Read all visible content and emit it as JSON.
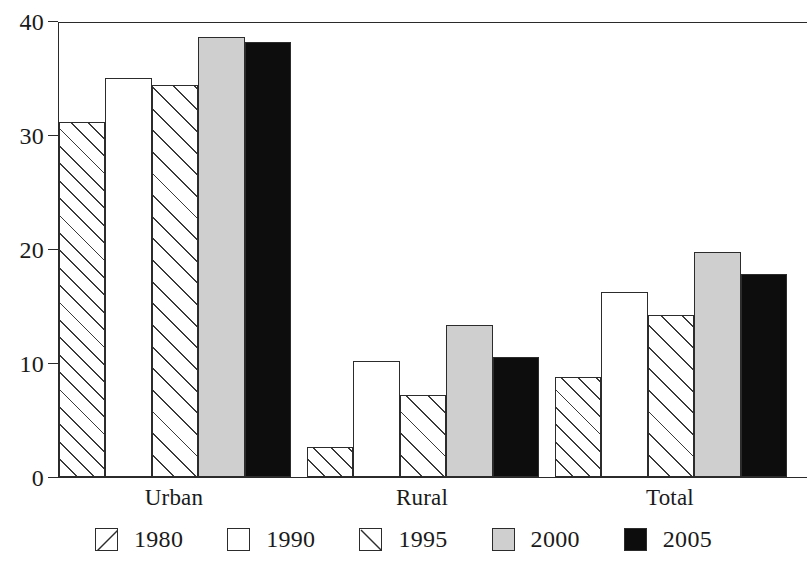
{
  "chart_data": {
    "type": "bar",
    "title": "",
    "subtitle": "",
    "xlabel": "",
    "ylabel": "",
    "categories": [
      "Urban",
      "Rural",
      "Total"
    ],
    "series": [
      {
        "name": "1980",
        "values": [
          31.1,
          2.6,
          8.8
        ],
        "fill": "hatch-forward",
        "color": "#ffffff"
      },
      {
        "name": "1990",
        "values": [
          35.0,
          10.2,
          16.2
        ],
        "fill": "white",
        "color": "#ffffff"
      },
      {
        "name": "1995",
        "values": [
          34.4,
          7.2,
          14.2
        ],
        "fill": "hatch-forward-wide",
        "color": "#ffffff"
      },
      {
        "name": "2000",
        "values": [
          38.6,
          13.3,
          19.7
        ],
        "fill": "solid",
        "color": "#cfcfcf"
      },
      {
        "name": "2005",
        "values": [
          38.2,
          10.5,
          17.8
        ],
        "fill": "solid",
        "color": "#0d0d0d"
      }
    ],
    "ylim": [
      0,
      40
    ],
    "yticks": [
      0,
      10,
      20,
      30,
      40
    ],
    "ytick_labels": [
      "0",
      "10",
      "20",
      "30",
      "40"
    ],
    "grid": false,
    "legend_position": "bottom",
    "legend_entries": [
      "1980",
      "1990",
      "1995",
      "2000",
      "2005"
    ],
    "annotations": [],
    "axis_color": "#2a2a2a"
  },
  "legend": {
    "items": [
      {
        "label": "1980",
        "key": "legend-key-hatch-forward"
      },
      {
        "label": "1990",
        "key": "legend-key-empty"
      },
      {
        "label": "1995",
        "key": "legend-key-hatch-backward"
      },
      {
        "label": "2000",
        "key": "legend-key-gray"
      },
      {
        "label": "2005",
        "key": "legend-key-black"
      }
    ]
  }
}
